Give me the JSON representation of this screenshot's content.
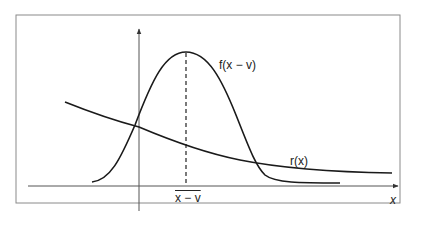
{
  "diagram": {
    "type": "function-plot",
    "frame": {
      "stroke": "#8a8a8a"
    },
    "axes": {
      "x_label": "x",
      "stroke": "#555555"
    },
    "curves": [
      {
        "name": "f",
        "label": "f(x − v)",
        "shape": "bell",
        "stroke": "#1a1a1a"
      },
      {
        "name": "r",
        "label": "r(x)",
        "shape": "decreasing",
        "stroke": "#1a1a1a"
      }
    ],
    "marker": {
      "label": "x − v",
      "overline": true,
      "style": "dashed"
    }
  }
}
